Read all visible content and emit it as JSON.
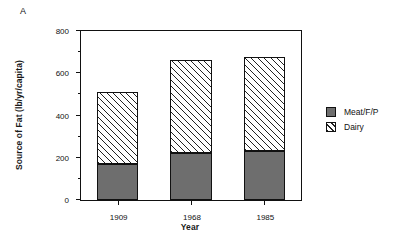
{
  "panel": {
    "label": "A"
  },
  "chart_data": {
    "type": "bar",
    "subtype": "stacked-bar",
    "title": "",
    "xlabel": "Year",
    "ylabel": "Source of Fat (lb/yr/capita)",
    "categories": [
      "1909",
      "1968",
      "1985"
    ],
    "series": [
      {
        "name": "Meat/F/P",
        "values": [
          170,
          222,
          232
        ],
        "style": "solid-gray",
        "color": "#6e6e6e"
      },
      {
        "name": "Dairy",
        "values": [
          341,
          441,
          445
        ],
        "style": "diagonal-hatch",
        "color": "#ffffff"
      }
    ],
    "totals": [
      511,
      663,
      677
    ],
    "ylim": [
      0,
      800
    ],
    "yticks": [
      0,
      200,
      400,
      600,
      800
    ],
    "ytick_labels": [
      "0",
      "200",
      "400",
      "600",
      "800"
    ],
    "yminor_ticks": [
      100,
      300,
      500,
      700
    ],
    "grid": false,
    "legend_position": "right",
    "legend_entries": [
      "Meat/F/P",
      "Dairy"
    ]
  }
}
